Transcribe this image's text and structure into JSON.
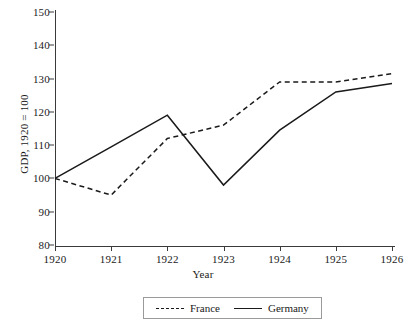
{
  "chart_data": {
    "type": "line",
    "title": "",
    "xlabel": "Year",
    "ylabel": "GDP, 1920 = 100",
    "x": [
      1920,
      1921,
      1922,
      1923,
      1924,
      1925,
      1926
    ],
    "xtick_labels": [
      "1920",
      "1921",
      "1922",
      "1923",
      "1924",
      "1925",
      "1926"
    ],
    "ytick_labels": [
      "80",
      "90",
      "100",
      "110",
      "120",
      "130",
      "140",
      "150"
    ],
    "yticks": [
      80,
      90,
      100,
      110,
      120,
      130,
      140,
      150
    ],
    "ylim": [
      80,
      150
    ],
    "xlim": [
      1920,
      1926
    ],
    "grid": false,
    "legend_position": "below-axis",
    "series": [
      {
        "name": "France",
        "style": "dashed",
        "color": "#1a1a1a",
        "values": [
          100,
          95,
          112,
          116,
          129,
          129,
          131.5
        ]
      },
      {
        "name": "Germany",
        "style": "solid",
        "color": "#1a1a1a",
        "values": [
          100,
          109.5,
          119,
          98,
          114.5,
          126,
          128.5
        ]
      }
    ]
  }
}
